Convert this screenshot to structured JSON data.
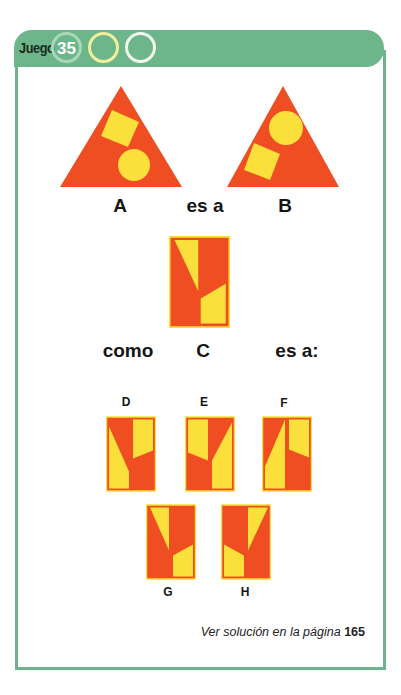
{
  "header": {
    "title": "Juego",
    "number": "35",
    "circles": [
      "35",
      "",
      ""
    ]
  },
  "colors": {
    "green": "#6db58a",
    "orange": "#ef4e23",
    "yellow": "#fbdf3a"
  },
  "puzzle": {
    "row1": {
      "a": "A",
      "connector": "es a",
      "b": "B"
    },
    "row2": {
      "como": "como",
      "c": "C",
      "connector": "es a:"
    },
    "options": [
      "D",
      "E",
      "F",
      "G",
      "H"
    ]
  },
  "footer": {
    "text": "Ver solución en la página",
    "page": "165"
  }
}
